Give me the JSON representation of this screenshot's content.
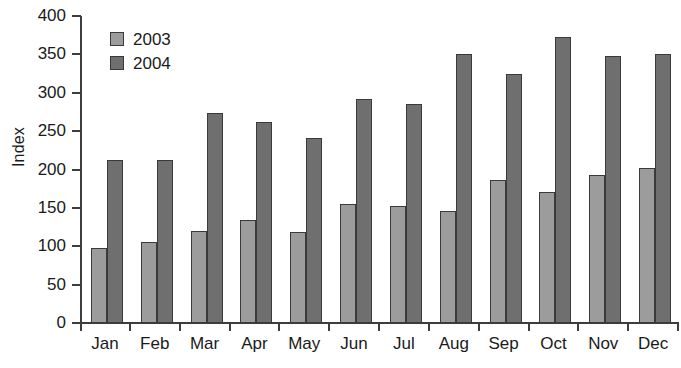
{
  "chart_data": {
    "type": "bar",
    "title": "",
    "xlabel": "",
    "ylabel": "Index",
    "ylim": [
      0,
      400
    ],
    "ytick_step": 50,
    "yticks": [
      400,
      350,
      300,
      250,
      200,
      150,
      100,
      50,
      0
    ],
    "grid": false,
    "legend_position": "top-left",
    "categories": [
      "Jan",
      "Feb",
      "Mar",
      "Apr",
      "May",
      "Jun",
      "Jul",
      "Aug",
      "Sep",
      "Oct",
      "Nov",
      "Dec"
    ],
    "series": [
      {
        "name": "2003",
        "color": "#9c9c9c",
        "values": [
          98,
          106,
          120,
          134,
          119,
          155,
          153,
          146,
          186,
          171,
          193,
          202
        ]
      },
      {
        "name": "2004",
        "color": "#6f6f6f",
        "values": [
          212,
          212,
          274,
          262,
          241,
          292,
          286,
          351,
          324,
          373,
          348,
          350
        ]
      }
    ]
  },
  "legend": {
    "items": [
      {
        "label": "2003",
        "color": "#9c9c9c"
      },
      {
        "label": "2004",
        "color": "#6f6f6f"
      }
    ]
  },
  "axes": {
    "y_title": "Index",
    "axis_color": "#3d3d3d"
  }
}
